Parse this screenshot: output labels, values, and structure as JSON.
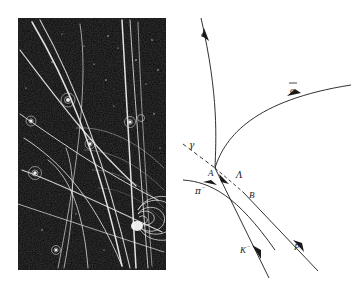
{
  "figure": {
    "background_color": "#ffffff"
  },
  "photo_panel": {
    "name": "bubble-chamber-photograph",
    "background_color": "#0a0a0a",
    "track_color": "#f2f2f2",
    "description": "Dark bubble chamber photograph with bright particle tracks, spiral electron track at lower right and several small spiral blobs"
  },
  "diagram_panel": {
    "name": "schematic-track-diagram",
    "line_color": "#1a1a1a",
    "labels": [
      {
        "id": "electron",
        "text": "e",
        "superscript": "",
        "overbar": false,
        "x": 24,
        "y": 37
      },
      {
        "id": "positron",
        "text": "e",
        "superscript": "",
        "overbar": true,
        "x": 113,
        "y": 93
      },
      {
        "id": "gamma",
        "text": "γ",
        "superscript": "",
        "overbar": false,
        "x": 12,
        "y": 148
      },
      {
        "id": "vertex-a",
        "text": "A",
        "superscript": "",
        "overbar": false,
        "x": 31,
        "y": 176
      },
      {
        "id": "lambda",
        "text": "Λ",
        "superscript": "",
        "overbar": false,
        "x": 59,
        "y": 178
      },
      {
        "id": "vertex-b",
        "text": "B",
        "superscript": "",
        "overbar": false,
        "x": 72,
        "y": 198
      },
      {
        "id": "pion",
        "text": "π",
        "superscript": "−",
        "overbar": false,
        "x": 18,
        "y": 194
      },
      {
        "id": "kaon",
        "text": "K",
        "superscript": "−",
        "overbar": false,
        "x": 63,
        "y": 253
      },
      {
        "id": "proton",
        "text": "P",
        "superscript": "",
        "overbar": false,
        "x": 117,
        "y": 250
      }
    ],
    "tracks": [
      {
        "id": "electron-track",
        "label": "e",
        "style": "solid",
        "arrow": true
      },
      {
        "id": "positron-track",
        "label": "ē",
        "style": "solid",
        "arrow": true
      },
      {
        "id": "gamma-track",
        "label": "γ",
        "style": "dashed",
        "arrow": false
      },
      {
        "id": "lambda-track",
        "label": "Λ",
        "style": "dashed",
        "arrow": true
      },
      {
        "id": "pion-track",
        "label": "π−",
        "style": "solid",
        "arrow": true
      },
      {
        "id": "kaon-track",
        "label": "K−",
        "style": "solid",
        "arrow": true
      },
      {
        "id": "proton-track",
        "label": "P",
        "style": "solid",
        "arrow": true
      }
    ],
    "vertices": [
      {
        "id": "A",
        "label": "A",
        "x": 38,
        "y": 168
      },
      {
        "id": "B",
        "label": "B",
        "x": 66,
        "y": 192
      }
    ]
  }
}
